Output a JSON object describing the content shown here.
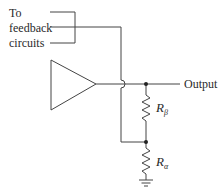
{
  "diagram": {
    "feedback_label": [
      "To",
      "feedback",
      "circuits"
    ],
    "output_label": "Output",
    "resistor_beta": {
      "symbol": "R",
      "subscript": "β"
    },
    "resistor_alpha": {
      "symbol": "R",
      "subscript": "α"
    },
    "colors": {
      "line": "#444444",
      "text": "#2a2a2a",
      "background": "#ffffff"
    }
  }
}
